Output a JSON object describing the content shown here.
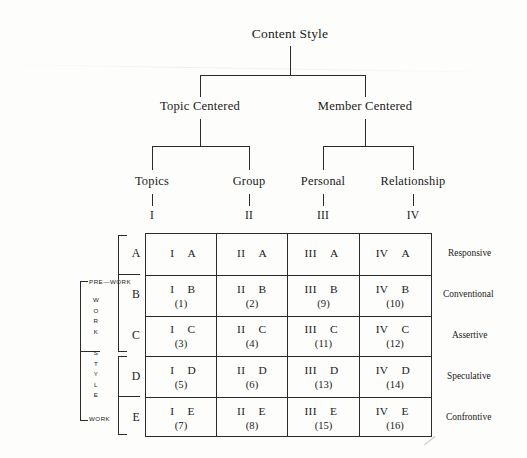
{
  "diagram": {
    "title": "Content Style",
    "level2": [
      {
        "label": "Topic Centered"
      },
      {
        "label": "Member Centered"
      }
    ],
    "level3": [
      {
        "label": "Topics",
        "numeral": "I"
      },
      {
        "label": "Group",
        "numeral": "II"
      },
      {
        "label": "Personal",
        "numeral": "III"
      },
      {
        "label": "Relationship",
        "numeral": "IV"
      }
    ],
    "row_letters": [
      "A",
      "B",
      "C",
      "D",
      "E"
    ],
    "right_labels": [
      "Responsive",
      "Conventional",
      "Assertive",
      "Speculative",
      "Confrontive"
    ],
    "left_axis": {
      "top_label": "PRE—WORK",
      "bottom_label": "WORK",
      "vertical_label": "WORK STYLE",
      "vertical_letters": [
        "W",
        "O",
        "R",
        "K",
        "",
        "S",
        "T",
        "Y",
        "L",
        "E"
      ]
    },
    "matrix": {
      "columns": [
        "I",
        "II",
        "III",
        "IV"
      ],
      "rows": [
        {
          "letter": "A",
          "cells": [
            {
              "numeral": "I",
              "letter": "A",
              "number": ""
            },
            {
              "numeral": "II",
              "letter": "A",
              "number": ""
            },
            {
              "numeral": "III",
              "letter": "A",
              "number": ""
            },
            {
              "numeral": "IV",
              "letter": "A",
              "number": ""
            }
          ]
        },
        {
          "letter": "B",
          "cells": [
            {
              "numeral": "I",
              "letter": "B",
              "number": "(1)"
            },
            {
              "numeral": "II",
              "letter": "B",
              "number": "(2)"
            },
            {
              "numeral": "III",
              "letter": "B",
              "number": "(9)"
            },
            {
              "numeral": "IV",
              "letter": "B",
              "number": "(10)"
            }
          ]
        },
        {
          "letter": "C",
          "cells": [
            {
              "numeral": "I",
              "letter": "C",
              "number": "(3)"
            },
            {
              "numeral": "II",
              "letter": "C",
              "number": "(4)"
            },
            {
              "numeral": "III",
              "letter": "C",
              "number": "(11)"
            },
            {
              "numeral": "IV",
              "letter": "C",
              "number": "(12)"
            }
          ]
        },
        {
          "letter": "D",
          "cells": [
            {
              "numeral": "I",
              "letter": "D",
              "number": "(5)"
            },
            {
              "numeral": "II",
              "letter": "D",
              "number": "(6)"
            },
            {
              "numeral": "III",
              "letter": "D",
              "number": "(13)"
            },
            {
              "numeral": "IV",
              "letter": "D",
              "number": "(14)"
            }
          ]
        },
        {
          "letter": "E",
          "cells": [
            {
              "numeral": "I",
              "letter": "E",
              "number": "(7)"
            },
            {
              "numeral": "II",
              "letter": "E",
              "number": "(8)"
            },
            {
              "numeral": "III",
              "letter": "E",
              "number": "(15)"
            },
            {
              "numeral": "IV",
              "letter": "E",
              "number": "(16)"
            }
          ]
        }
      ]
    },
    "colors": {
      "ink": "#2b2b2b",
      "background": "#fdfdfc"
    }
  }
}
